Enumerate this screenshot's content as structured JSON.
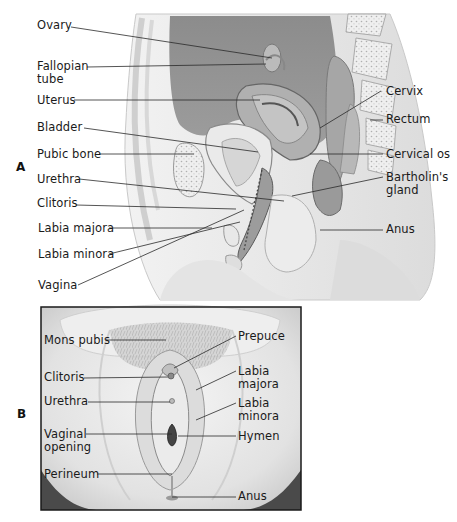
{
  "figure": {
    "panel_a": {
      "letter": "A",
      "description": "Sagittal section of female pelvis",
      "left_labels": [
        {
          "id": "ovary",
          "text": "Ovary"
        },
        {
          "id": "fallopian-tube",
          "text": "Fallopian",
          "text2": "tube"
        },
        {
          "id": "uterus",
          "text": "Uterus"
        },
        {
          "id": "bladder",
          "text": "Bladder"
        },
        {
          "id": "pubic-bone",
          "text": "Pubic bone"
        },
        {
          "id": "urethra",
          "text": "Urethra"
        },
        {
          "id": "clitoris",
          "text": "Clitoris"
        },
        {
          "id": "labia-majora",
          "text": "Labia majora"
        },
        {
          "id": "labia-minora",
          "text": "Labia minora"
        },
        {
          "id": "vagina",
          "text": "Vagina"
        }
      ],
      "right_labels": [
        {
          "id": "cervix",
          "text": "Cervix"
        },
        {
          "id": "rectum",
          "text": "Rectum"
        },
        {
          "id": "cervical-os",
          "text": "Cervical os"
        },
        {
          "id": "bartholins-gland",
          "text": "Bartholin's",
          "text2": "gland"
        },
        {
          "id": "anus",
          "text": "Anus"
        }
      ]
    },
    "panel_b": {
      "letter": "B",
      "description": "External female genitalia",
      "left_labels": [
        {
          "id": "mons-pubis",
          "text": "Mons pubis"
        },
        {
          "id": "clitoris",
          "text": "Clitoris"
        },
        {
          "id": "urethra",
          "text": "Urethra"
        },
        {
          "id": "vaginal-opening",
          "text": "Vaginal",
          "text2": "opening"
        },
        {
          "id": "perineum",
          "text": "Perineum"
        }
      ],
      "right_labels": [
        {
          "id": "prepuce",
          "text": "Prepuce"
        },
        {
          "id": "labia-majora",
          "text": "Labia",
          "text2": "majora"
        },
        {
          "id": "labia-minora",
          "text": "Labia",
          "text2": "minora"
        },
        {
          "id": "hymen",
          "text": "Hymen"
        },
        {
          "id": "anus",
          "text": "Anus"
        }
      ]
    },
    "colors": {
      "background": "#ffffff",
      "tissue_dark": "#8a8a8a",
      "tissue_mid": "#bdbdbd",
      "tissue_light": "#e6e6e6",
      "line": "#222222",
      "frame": "#1a1a1a"
    }
  }
}
